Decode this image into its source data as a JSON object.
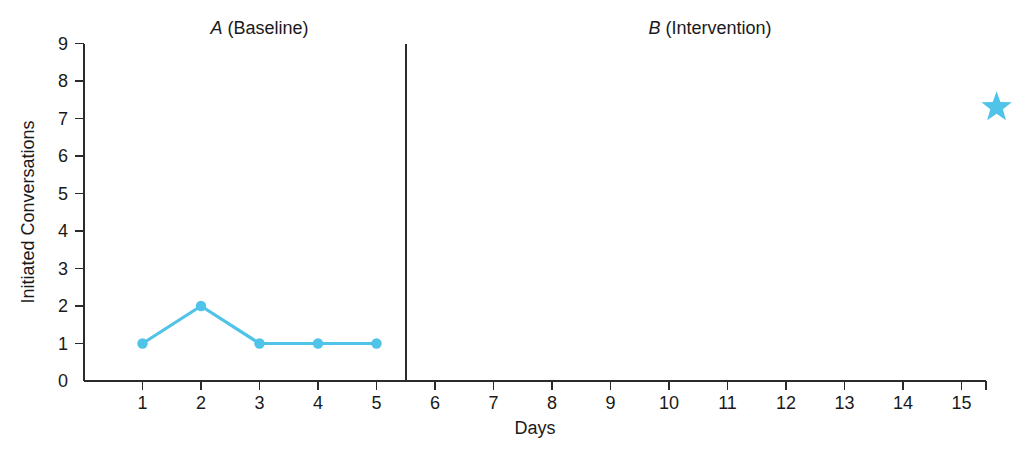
{
  "chart_data": {
    "type": "line",
    "title": "",
    "xlabel": "Days",
    "ylabel": "Initiated Conversations",
    "xlim": [
      0,
      16
    ],
    "ylim": [
      0,
      9
    ],
    "grid": false,
    "legend": "none",
    "x_ticks": [
      1,
      2,
      3,
      4,
      5,
      6,
      7,
      8,
      9,
      10,
      11,
      12,
      13,
      14,
      15
    ],
    "x_tick_labels": [
      "1",
      "2",
      "3",
      "4",
      "5",
      "6",
      "7",
      "8",
      "9",
      "10",
      "11",
      "12",
      "13",
      "14",
      "15"
    ],
    "y_ticks": [
      0,
      1,
      2,
      3,
      4,
      5,
      6,
      7,
      8,
      9
    ],
    "y_tick_labels": [
      "0",
      "1",
      "2",
      "3",
      "4",
      "5",
      "6",
      "7",
      "8",
      "9"
    ],
    "series": [
      {
        "name": "Initiated Conversations",
        "phase": "A (Baseline)",
        "color": "#4FC3E8",
        "marker": "circle",
        "x": [
          1,
          2,
          3,
          4,
          5
        ],
        "values": [
          1,
          2,
          1,
          1,
          1
        ]
      }
    ],
    "annotations": [
      {
        "name": "goal-star",
        "label": "",
        "marker": "star",
        "color": "#4FC3E8",
        "x": 15.6,
        "y": 7.3
      }
    ],
    "phase_change_lines": [
      {
        "name": "phase-change-line",
        "x": 5.5,
        "y_top": 9,
        "y_bottom": 0
      }
    ],
    "phase_labels": [
      {
        "name": "phase-a",
        "italic_part": "A",
        "normal_part": " (Baseline)",
        "x": 3.0,
        "y": 9.25
      },
      {
        "name": "phase-b",
        "italic_part": "B",
        "normal_part": " (Intervention)",
        "x": 10.7,
        "y": 9.25
      }
    ]
  },
  "colors": {
    "series": "#4FC3E8",
    "axis": "#2b2b2b",
    "background": "#ffffff",
    "text": "#1a1a1a"
  }
}
